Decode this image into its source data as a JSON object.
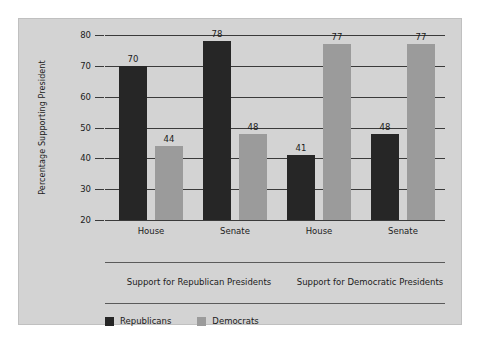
{
  "chart_data": {
    "type": "bar",
    "title": "",
    "xlabel": "",
    "ylabel": "Percentage Supporting President",
    "ylim": [
      20,
      80
    ],
    "ytick_step": 10,
    "yticks": [
      20,
      30,
      40,
      50,
      60,
      70,
      80
    ],
    "grid": true,
    "legend_position": "bottom-left",
    "categories": [
      "House",
      "Senate",
      "House",
      "Senate"
    ],
    "groups": [
      {
        "label": "Support for Republican Presidents",
        "categories": [
          "House",
          "Senate"
        ]
      },
      {
        "label": "Support for Democratic Presidents",
        "categories": [
          "House",
          "Senate"
        ]
      }
    ],
    "series": [
      {
        "name": "Republicans",
        "color": "#262626",
        "values": [
          70,
          78,
          41,
          48
        ]
      },
      {
        "name": "Democrats",
        "color": "#9b9b9b",
        "values": [
          44,
          48,
          77,
          77
        ]
      }
    ],
    "bars": [
      {
        "group": 0,
        "category": "House",
        "series": "Republicans",
        "value": 70
      },
      {
        "group": 0,
        "category": "House",
        "series": "Democrats",
        "value": 44
      },
      {
        "group": 0,
        "category": "Senate",
        "series": "Republicans",
        "value": 78
      },
      {
        "group": 0,
        "category": "Senate",
        "series": "Democrats",
        "value": 48
      },
      {
        "group": 1,
        "category": "House",
        "series": "Republicans",
        "value": 41
      },
      {
        "group": 1,
        "category": "House",
        "series": "Democrats",
        "value": 77
      },
      {
        "group": 1,
        "category": "Senate",
        "series": "Republicans",
        "value": 48
      },
      {
        "group": 1,
        "category": "Senate",
        "series": "Democrats",
        "value": 77
      }
    ]
  },
  "colors": {
    "panel_background": "#d3d3d3",
    "republican_bar": "#262626",
    "democrat_bar": "#9b9b9b",
    "axis_line": "#3a3a3a",
    "text": "#1b1b1b"
  },
  "legend": {
    "items": [
      {
        "label": "Republicans",
        "color": "#262626"
      },
      {
        "label": "Democrats",
        "color": "#9b9b9b"
      }
    ]
  }
}
